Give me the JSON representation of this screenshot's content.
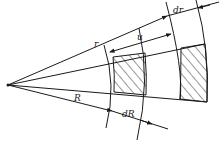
{
  "diagram": {
    "title": "",
    "labels": {
      "r": "r",
      "u": "u",
      "dr": "dr",
      "R": "R",
      "dR": "dR"
    },
    "colors": {
      "line": "#1a1a1a",
      "background": "#ffffff"
    },
    "elements": [
      {
        "name": "apex",
        "desc": "origin point of all radial lines"
      },
      {
        "name": "inner-hatched-element",
        "desc": "annular sector element of width dR at radius R"
      },
      {
        "name": "outer-hatched-element",
        "desc": "annular sector element of width dr at radius r (displaced by u)"
      }
    ]
  }
}
